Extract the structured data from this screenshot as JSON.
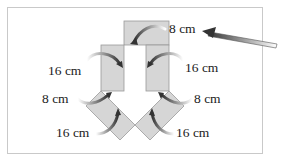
{
  "diagram": {
    "colors": {
      "shape_fill": "#d6d6d6",
      "shape_stroke": "#9a9a9a",
      "arrow_dark": "#3a3a3a",
      "arrow_light": "#ffffff",
      "frame_border": "#c9c9c9"
    },
    "labels": {
      "top": "8 cm",
      "left_middle": "16 cm",
      "right_middle": "16 cm",
      "left_lower": "8 cm",
      "right_lower": "8 cm",
      "left_bottom": "16 cm",
      "right_bottom": "16 cm"
    },
    "pointer_arrow": "pointer-arrow-to-top-label"
  }
}
